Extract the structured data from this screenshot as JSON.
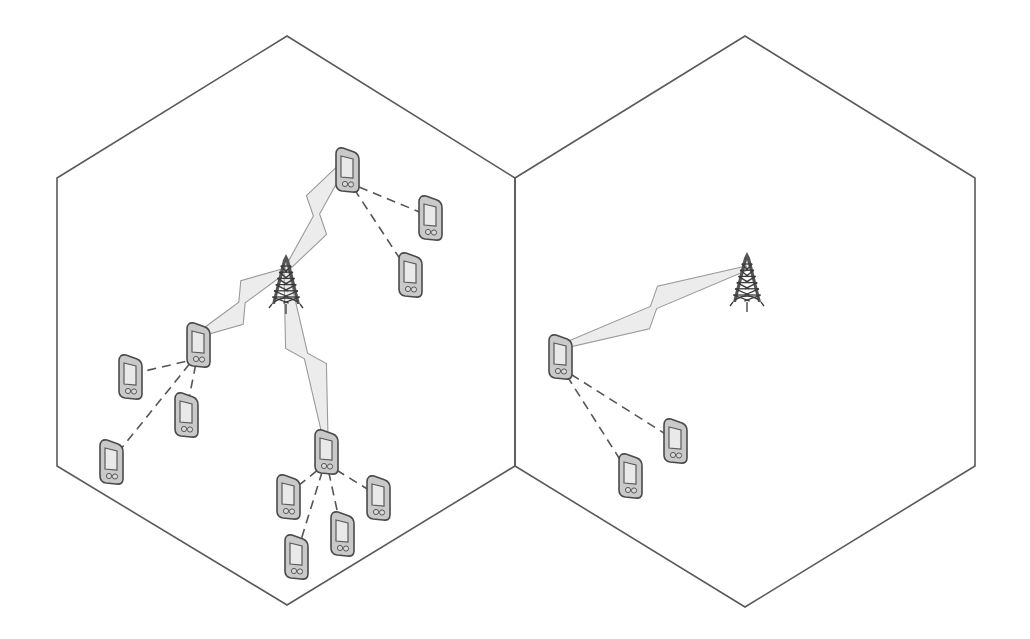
{
  "diagram": {
    "type": "cellular-network-d2d",
    "colors": {
      "background": "#ffffff",
      "cell_edge": "#5a5a5a",
      "device_body": "#c9c9c9",
      "device_outline": "#4a4a4a",
      "bolt_fill": "#ececec",
      "d2d_link": "#555555"
    },
    "cells": [
      {
        "id": "cell-left",
        "points": [
          [
            57,
            178
          ],
          [
            287,
            36
          ],
          [
            515,
            178
          ],
          [
            515,
            466
          ],
          [
            287,
            605
          ],
          [
            57,
            466
          ]
        ],
        "base_station": {
          "id": "bs-left",
          "x": 286,
          "y": 290
        },
        "devices": [
          {
            "id": "relay-top",
            "x": 347,
            "y": 170,
            "role": "relay"
          },
          {
            "id": "ue-top-1",
            "x": 430,
            "y": 218,
            "role": "ue"
          },
          {
            "id": "ue-top-2",
            "x": 410,
            "y": 275,
            "role": "ue"
          },
          {
            "id": "relay-left",
            "x": 198,
            "y": 345,
            "role": "relay"
          },
          {
            "id": "ue-left-1",
            "x": 130,
            "y": 377,
            "role": "ue"
          },
          {
            "id": "ue-left-2",
            "x": 186,
            "y": 415,
            "role": "ue"
          },
          {
            "id": "ue-left-3",
            "x": 111,
            "y": 462,
            "role": "ue"
          },
          {
            "id": "relay-bottom",
            "x": 326,
            "y": 452,
            "role": "relay"
          },
          {
            "id": "ue-bottom-1",
            "x": 288,
            "y": 497,
            "role": "ue"
          },
          {
            "id": "ue-bottom-2",
            "x": 378,
            "y": 498,
            "role": "ue"
          },
          {
            "id": "ue-bottom-3",
            "x": 342,
            "y": 534,
            "role": "ue"
          },
          {
            "id": "ue-bottom-4",
            "x": 296,
            "y": 557,
            "role": "ue"
          }
        ],
        "cellular_links": [
          {
            "from": "bs-left",
            "to": "relay-top"
          },
          {
            "from": "bs-left",
            "to": "relay-left"
          },
          {
            "from": "bs-left",
            "to": "relay-bottom"
          }
        ],
        "d2d_links": [
          {
            "from": "relay-top",
            "to": "ue-top-1"
          },
          {
            "from": "relay-top",
            "to": "ue-top-2"
          },
          {
            "from": "relay-left",
            "to": "ue-left-1"
          },
          {
            "from": "relay-left",
            "to": "ue-left-2"
          },
          {
            "from": "relay-left",
            "to": "ue-left-3"
          },
          {
            "from": "relay-bottom",
            "to": "ue-bottom-1"
          },
          {
            "from": "relay-bottom",
            "to": "ue-bottom-2"
          },
          {
            "from": "relay-bottom",
            "to": "ue-bottom-3"
          },
          {
            "from": "relay-bottom",
            "to": "ue-bottom-4"
          }
        ]
      },
      {
        "id": "cell-right",
        "points": [
          [
            515,
            178
          ],
          [
            745,
            36
          ],
          [
            975,
            178
          ],
          [
            975,
            466
          ],
          [
            745,
            607
          ],
          [
            515,
            466
          ]
        ],
        "base_station": {
          "id": "bs-right",
          "x": 747,
          "y": 288
        },
        "devices": [
          {
            "id": "relay-right",
            "x": 560,
            "y": 357,
            "role": "relay"
          },
          {
            "id": "ue-right-1",
            "x": 675,
            "y": 441,
            "role": "ue"
          },
          {
            "id": "ue-right-2",
            "x": 630,
            "y": 476,
            "role": "ue"
          }
        ],
        "cellular_links": [
          {
            "from": "bs-right",
            "to": "relay-right"
          }
        ],
        "d2d_links": [
          {
            "from": "relay-right",
            "to": "ue-right-1"
          },
          {
            "from": "relay-right",
            "to": "ue-right-2"
          }
        ]
      }
    ]
  }
}
